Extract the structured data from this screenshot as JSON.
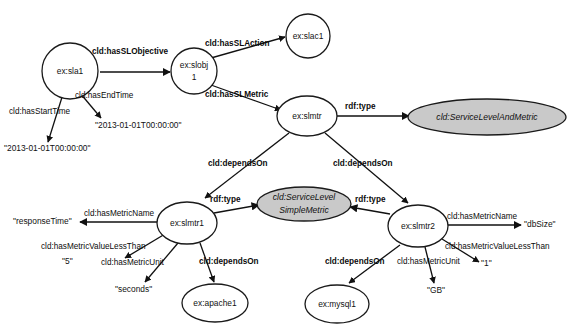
{
  "diagram": {
    "colors": {
      "background": "#ffffff",
      "node_fill": "#ffffff",
      "class_node_fill": "#c9c9c9",
      "stroke": "#1a1a1a",
      "text": "#111111"
    }
  },
  "nodes": [
    {
      "id": "sla1",
      "label": "ex:sla1",
      "shape": "circle"
    },
    {
      "id": "slobj1",
      "label_line1": "ex:slobj",
      "label_line2": "1",
      "shape": "circle"
    },
    {
      "id": "slac1",
      "label": "ex:slac1",
      "shape": "circle"
    },
    {
      "id": "slmtr",
      "label": "ex:slmtr",
      "shape": "ellipse"
    },
    {
      "id": "slam_class",
      "label": "cld:ServiceLevelAndMetric",
      "shape": "ellipse-shaded"
    },
    {
      "id": "slsm_class",
      "label_line1": "cld:ServiceLevel",
      "label_line2": "SimpleMetric",
      "shape": "ellipse-shaded"
    },
    {
      "id": "slmtr1",
      "label": "ex:slmtr1",
      "shape": "ellipse"
    },
    {
      "id": "slmtr2",
      "label": "ex:slmtr2",
      "shape": "ellipse"
    },
    {
      "id": "apache1",
      "label": "ex:apache1",
      "shape": "ellipse"
    },
    {
      "id": "mysql1",
      "label": "ex:mysql1",
      "shape": "ellipse"
    }
  ],
  "literals": [
    {
      "id": "start_time",
      "text": "\"2013-01-01T00:00:00\""
    },
    {
      "id": "end_time",
      "text": "\"2013-01-01T00:00:00\""
    },
    {
      "id": "response_time",
      "text": "\"responseTime\""
    },
    {
      "id": "value_five",
      "text": "\"5\""
    },
    {
      "id": "unit_seconds",
      "text": "\"seconds\""
    },
    {
      "id": "db_size",
      "text": "\"dbSize\""
    },
    {
      "id": "value_one",
      "text": "\"1\""
    },
    {
      "id": "unit_gb",
      "text": "\"GB\""
    }
  ],
  "edges": [
    {
      "id": "e1",
      "label": "cld:hasSLObjective",
      "bold": true,
      "from": "sla1",
      "to": "slobj1"
    },
    {
      "id": "e2",
      "label": "cld:hasStartTime",
      "bold": false,
      "from": "sla1",
      "to": "start_time"
    },
    {
      "id": "e3",
      "label": "cld:hasEndTime",
      "bold": false,
      "from": "sla1",
      "to": "end_time"
    },
    {
      "id": "e4",
      "label": "cld:hasSLAction",
      "bold": true,
      "from": "slobj1",
      "to": "slac1"
    },
    {
      "id": "e5",
      "label": "cld:hasSLMetric",
      "bold": true,
      "from": "slobj1",
      "to": "slmtr"
    },
    {
      "id": "e6",
      "label": "rdf:type",
      "bold": true,
      "from": "slmtr",
      "to": "slam_class"
    },
    {
      "id": "e7",
      "label": "cld:dependsOn",
      "bold": true,
      "from": "slmtr",
      "to": "slmtr1"
    },
    {
      "id": "e8",
      "label": "cld:dependsOn",
      "bold": true,
      "from": "slmtr",
      "to": "slmtr2"
    },
    {
      "id": "e9",
      "label": "rdf:type",
      "bold": true,
      "from": "slmtr1",
      "to": "slsm_class"
    },
    {
      "id": "e10",
      "label": "rdf:type",
      "bold": true,
      "from": "slmtr2",
      "to": "slsm_class"
    },
    {
      "id": "e11",
      "label": "cld:hasMetricName",
      "bold": false,
      "from": "slmtr1",
      "to": "response_time"
    },
    {
      "id": "e12",
      "label": "cld:hasMetricValueLessThan",
      "bold": false,
      "from": "slmtr1",
      "to": "value_five"
    },
    {
      "id": "e13",
      "label": "cld:hasMetricUnit",
      "bold": false,
      "from": "slmtr1",
      "to": "unit_seconds"
    },
    {
      "id": "e14",
      "label": "cld:dependsOn",
      "bold": true,
      "from": "slmtr1",
      "to": "apache1"
    },
    {
      "id": "e15",
      "label": "cld:hasMetricName",
      "bold": false,
      "from": "slmtr2",
      "to": "db_size"
    },
    {
      "id": "e16",
      "label": "cld:hasMetricValueLessThan",
      "bold": false,
      "from": "slmtr2",
      "to": "value_one"
    },
    {
      "id": "e17",
      "label": "cld:hasMetricUnit",
      "bold": false,
      "from": "slmtr2",
      "to": "unit_gb"
    },
    {
      "id": "e18",
      "label": "cld:dependsOn",
      "bold": true,
      "from": "slmtr2",
      "to": "mysql1"
    }
  ]
}
